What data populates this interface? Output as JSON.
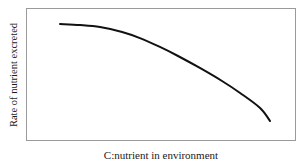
{
  "chart_data": {
    "type": "line",
    "title": "",
    "xlabel": "C:nutrient in environment",
    "ylabel": "Rate of nutrient excreted",
    "grid": false,
    "legend": null,
    "axis_ticks": {
      "x": [],
      "y": []
    },
    "xlim": [
      0,
      100
    ],
    "ylim": [
      0,
      100
    ],
    "series": [
      {
        "name": "nutrient excretion rate",
        "color": "#111111",
        "line_width": 2,
        "x": [
          12.6,
          20,
          27.4,
          35.6,
          42.2,
          49.6,
          56.3,
          64.4,
          72.6,
          79.3,
          86.7,
          90.4
        ],
        "y": [
          88.0,
          87.2,
          85.7,
          82.0,
          77.4,
          70.7,
          63.9,
          54.9,
          45.1,
          36.1,
          24.8,
          15.0
        ]
      }
    ]
  },
  "figure": {
    "background_color": "#ffffff",
    "frame_color": "#9a9a9a",
    "curve_color": "#111111"
  }
}
